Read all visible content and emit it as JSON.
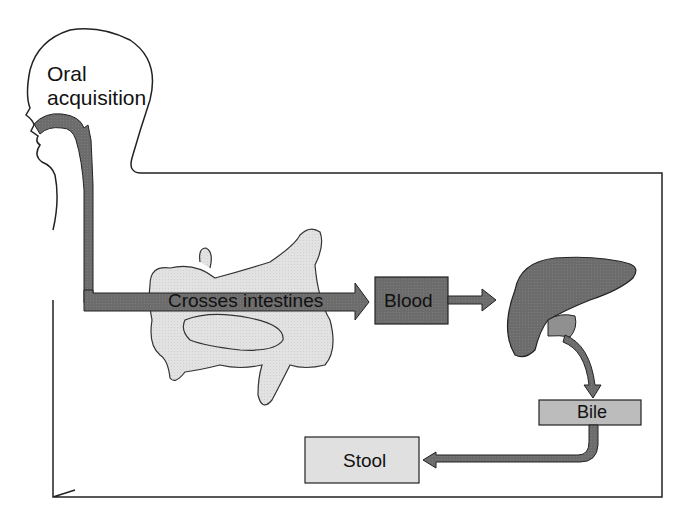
{
  "diagram": {
    "title_label": "Oral\nacquisition",
    "title_line1": "Oral",
    "title_line2": "acquisition",
    "nodes": {
      "intestines_arrow": "Crosses intestines",
      "blood": "Blood",
      "bile": "Bile",
      "stool": "Stool"
    },
    "flow": [
      "Oral acquisition",
      "Crosses intestines",
      "Blood",
      "Liver",
      "Bile",
      "Stool"
    ],
    "colors": {
      "dark_fill": "#6f6f6f",
      "medium_fill": "#8a8a8a",
      "light_fill": "#bdbdbd",
      "pale_fill": "#e0e0e0",
      "outline": "#2a2a2a"
    }
  }
}
